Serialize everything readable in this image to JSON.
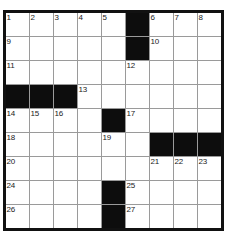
{
  "puzzle": {
    "title": "Crossword Grid",
    "rows": 9,
    "cols": 9,
    "cell_size_px": 23,
    "colors": {
      "background": "#ffffff",
      "cell_white": "#ffffff",
      "cell_black": "#0d0d0d",
      "gridline": "#9a9a9a",
      "border": "#111111",
      "number_text": "#1a1a1a"
    },
    "grid": [
      [
        {
          "type": "white",
          "number": "1"
        },
        {
          "type": "white",
          "number": "2"
        },
        {
          "type": "white",
          "number": "3"
        },
        {
          "type": "white",
          "number": "4"
        },
        {
          "type": "white",
          "number": "5"
        },
        {
          "type": "black",
          "number": ""
        },
        {
          "type": "white",
          "number": "6"
        },
        {
          "type": "white",
          "number": "7"
        },
        {
          "type": "white",
          "number": "8"
        }
      ],
      [
        {
          "type": "white",
          "number": "9"
        },
        {
          "type": "white",
          "number": ""
        },
        {
          "type": "white",
          "number": ""
        },
        {
          "type": "white",
          "number": ""
        },
        {
          "type": "white",
          "number": ""
        },
        {
          "type": "black",
          "number": ""
        },
        {
          "type": "white",
          "number": "10"
        },
        {
          "type": "white",
          "number": ""
        },
        {
          "type": "white",
          "number": ""
        }
      ],
      [
        {
          "type": "white",
          "number": "11"
        },
        {
          "type": "white",
          "number": ""
        },
        {
          "type": "white",
          "number": ""
        },
        {
          "type": "white",
          "number": ""
        },
        {
          "type": "white",
          "number": ""
        },
        {
          "type": "white",
          "number": "12"
        },
        {
          "type": "white",
          "number": ""
        },
        {
          "type": "white",
          "number": ""
        },
        {
          "type": "white",
          "number": ""
        }
      ],
      [
        {
          "type": "black",
          "number": ""
        },
        {
          "type": "black",
          "number": ""
        },
        {
          "type": "black",
          "number": ""
        },
        {
          "type": "white",
          "number": "13"
        },
        {
          "type": "white",
          "number": ""
        },
        {
          "type": "white",
          "number": ""
        },
        {
          "type": "white",
          "number": ""
        },
        {
          "type": "white",
          "number": ""
        },
        {
          "type": "white",
          "number": ""
        }
      ],
      [
        {
          "type": "white",
          "number": "14"
        },
        {
          "type": "white",
          "number": "15"
        },
        {
          "type": "white",
          "number": "16"
        },
        {
          "type": "white",
          "number": ""
        },
        {
          "type": "black",
          "number": ""
        },
        {
          "type": "white",
          "number": "17"
        },
        {
          "type": "white",
          "number": ""
        },
        {
          "type": "white",
          "number": ""
        },
        {
          "type": "white",
          "number": ""
        }
      ],
      [
        {
          "type": "white",
          "number": "18"
        },
        {
          "type": "white",
          "number": ""
        },
        {
          "type": "white",
          "number": ""
        },
        {
          "type": "white",
          "number": ""
        },
        {
          "type": "white",
          "number": "19"
        },
        {
          "type": "white",
          "number": ""
        },
        {
          "type": "black",
          "number": ""
        },
        {
          "type": "black",
          "number": ""
        },
        {
          "type": "black",
          "number": ""
        }
      ],
      [
        {
          "type": "white",
          "number": "20"
        },
        {
          "type": "white",
          "number": ""
        },
        {
          "type": "white",
          "number": ""
        },
        {
          "type": "white",
          "number": ""
        },
        {
          "type": "white",
          "number": ""
        },
        {
          "type": "white",
          "number": ""
        },
        {
          "type": "white",
          "number": "21"
        },
        {
          "type": "white",
          "number": "22"
        },
        {
          "type": "white",
          "number": "23"
        }
      ],
      [
        {
          "type": "white",
          "number": "24"
        },
        {
          "type": "white",
          "number": ""
        },
        {
          "type": "white",
          "number": ""
        },
        {
          "type": "white",
          "number": ""
        },
        {
          "type": "black",
          "number": ""
        },
        {
          "type": "white",
          "number": "25"
        },
        {
          "type": "white",
          "number": ""
        },
        {
          "type": "white",
          "number": ""
        },
        {
          "type": "white",
          "number": ""
        }
      ],
      [
        {
          "type": "white",
          "number": "26"
        },
        {
          "type": "white",
          "number": ""
        },
        {
          "type": "white",
          "number": ""
        },
        {
          "type": "white",
          "number": ""
        },
        {
          "type": "black",
          "number": ""
        },
        {
          "type": "white",
          "number": "27"
        },
        {
          "type": "white",
          "number": ""
        },
        {
          "type": "white",
          "number": ""
        },
        {
          "type": "white",
          "number": ""
        }
      ]
    ]
  }
}
